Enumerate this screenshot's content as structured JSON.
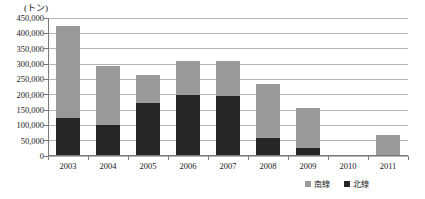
{
  "chart_data": {
    "type": "bar",
    "subtype": "stacked-column",
    "title": "",
    "unit_caption": "(トン)",
    "xlabel": "",
    "ylabel": "",
    "ylim": [
      0,
      450000
    ],
    "ytick_values": [
      0,
      50000,
      100000,
      150000,
      200000,
      250000,
      300000,
      350000,
      400000,
      450000
    ],
    "ytick_labels": [
      "0",
      "50,000",
      "100,000",
      "150,000",
      "200,000",
      "250,000",
      "300,000",
      "350,000",
      "400,000",
      "450,000"
    ],
    "categories": [
      "2003",
      "2004",
      "2005",
      "2006",
      "2007",
      "2008",
      "2009",
      "2010",
      "2011"
    ],
    "grid": true,
    "legend_position": "bottom-right",
    "series": [
      {
        "name": "北線",
        "color": "#262626",
        "stack_order": 1,
        "values": [
          125000,
          100000,
          172000,
          200000,
          195000,
          60000,
          25000,
          0,
          0
        ]
      },
      {
        "name": "南線",
        "color": "#9a9a9a",
        "stack_order": 2,
        "values": [
          300000,
          195000,
          93000,
          110000,
          115000,
          175000,
          130000,
          2000,
          70000
        ]
      }
    ],
    "totals": [
      425000,
      295000,
      265000,
      310000,
      310000,
      235000,
      155000,
      2000,
      70000
    ]
  },
  "colors": {
    "series_north": "#262626",
    "series_south": "#9a9a9a",
    "gridline": "#b4b4b4",
    "axis": "#7a7a7a",
    "text": "#1a1a1a",
    "background": "#ffffff"
  }
}
